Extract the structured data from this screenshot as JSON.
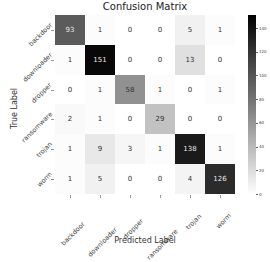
{
  "chart_data": {
    "type": "heatmap",
    "title": "Confusion Matrix",
    "xlabel": "Predicted Label",
    "ylabel": "True Label",
    "x_categories": [
      "backdoor",
      "downloader",
      "dropper",
      "ransomware",
      "trojan",
      "worm"
    ],
    "y_categories": [
      "backdoor",
      "downloader",
      "dropper",
      "ransomware",
      "trojan",
      "worm"
    ],
    "matrix": [
      [
        93,
        1,
        0,
        0,
        5,
        1
      ],
      [
        1,
        151,
        0,
        0,
        13,
        0
      ],
      [
        0,
        1,
        58,
        1,
        0,
        1
      ],
      [
        2,
        1,
        0,
        29,
        0,
        0
      ],
      [
        1,
        9,
        3,
        1,
        138,
        1
      ],
      [
        1,
        5,
        0,
        0,
        4,
        126
      ]
    ],
    "colormap": "Greys",
    "colorbar": {
      "ticks": [
        0,
        20,
        40,
        60,
        80,
        100,
        120,
        140
      ],
      "vmin": 0,
      "vmax": 151
    }
  }
}
